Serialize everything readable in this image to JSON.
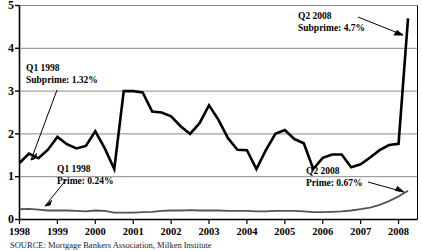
{
  "figure": {
    "source_label": "SOURCE:",
    "source_text": "Mortgage Bankers Association, Milken Institute"
  },
  "chart_data": {
    "type": "line",
    "title": "",
    "subtitle": "",
    "xlabel": "",
    "ylabel": "",
    "xlim": [
      1998.0,
      2008.5
    ],
    "ylim": [
      0,
      5
    ],
    "grid": true,
    "grid_axis": "y",
    "legend_position": "none",
    "y_ticks": [
      0,
      1,
      2,
      3,
      4,
      5
    ],
    "y_tick_labels": [
      "0",
      "1",
      "2",
      "3",
      "4",
      "5"
    ],
    "x_ticks": [
      1998,
      1999,
      2000,
      2001,
      2002,
      2003,
      2004,
      2005,
      2006,
      2007,
      2008
    ],
    "x_tick_labels": [
      "1998",
      "1999",
      "2000",
      "2001",
      "2002",
      "2003",
      "2004",
      "2005",
      "2006",
      "2007",
      "2008"
    ],
    "x": [
      1998.0,
      1998.25,
      1998.5,
      1998.75,
      1999.0,
      1999.25,
      1999.5,
      1999.75,
      2000.0,
      2000.25,
      2000.5,
      2000.75,
      2001.0,
      2001.25,
      2001.5,
      2001.75,
      2002.0,
      2002.25,
      2002.5,
      2002.75,
      2003.0,
      2003.25,
      2003.5,
      2003.75,
      2004.0,
      2004.25,
      2004.5,
      2004.75,
      2005.0,
      2005.25,
      2005.5,
      2005.75,
      2006.0,
      2006.25,
      2006.5,
      2006.75,
      2007.0,
      2007.25,
      2007.5,
      2007.75,
      2008.0,
      2008.25
    ],
    "series": [
      {
        "name": "Subprime",
        "color": "#000000",
        "line_width": 2.6,
        "values": [
          1.32,
          1.54,
          1.43,
          1.63,
          1.93,
          1.76,
          1.66,
          1.72,
          2.06,
          1.66,
          1.18,
          3.0,
          3.0,
          2.97,
          2.52,
          2.5,
          2.41,
          2.18,
          2.0,
          2.25,
          2.67,
          2.33,
          1.9,
          1.63,
          1.62,
          1.18,
          1.62,
          2.0,
          2.09,
          1.88,
          1.78,
          1.18,
          1.44,
          1.52,
          1.52,
          1.22,
          1.29,
          1.45,
          1.62,
          1.74,
          1.77,
          4.7
        ]
      },
      {
        "name": "Prime",
        "color": "#555555",
        "line_width": 1.8,
        "values": [
          0.24,
          0.25,
          0.23,
          0.21,
          0.21,
          0.21,
          0.2,
          0.19,
          0.21,
          0.2,
          0.16,
          0.16,
          0.16,
          0.17,
          0.18,
          0.2,
          0.21,
          0.21,
          0.22,
          0.21,
          0.21,
          0.21,
          0.2,
          0.2,
          0.2,
          0.19,
          0.19,
          0.2,
          0.2,
          0.2,
          0.19,
          0.17,
          0.17,
          0.18,
          0.19,
          0.21,
          0.24,
          0.28,
          0.34,
          0.43,
          0.54,
          0.67
        ]
      }
    ],
    "annotations": [
      {
        "id": "q1-1998-subprime",
        "line1": "Q1 1998",
        "line2": "Subprime: 1.32%",
        "value": 1.32,
        "period": "Q1 1998",
        "series": "Subprime"
      },
      {
        "id": "q1-1998-prime",
        "line1": "Q1 1998",
        "line2": "Prime: 0.24%",
        "value": 0.24,
        "period": "Q1 1998",
        "series": "Prime"
      },
      {
        "id": "q2-2008-subprime",
        "line1": "Q2 2008",
        "line2": "Subprime: 4.7%",
        "value": 4.7,
        "period": "Q2 2008",
        "series": "Subprime"
      },
      {
        "id": "q2-2008-prime",
        "line1": "Q2 2008",
        "line2": "Prime: 0.67%",
        "value": 0.67,
        "period": "Q2 2008",
        "series": "Prime"
      }
    ]
  }
}
